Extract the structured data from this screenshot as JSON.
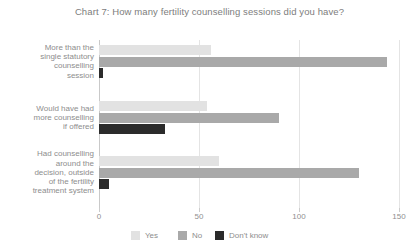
{
  "chart_data": {
    "type": "bar",
    "orientation": "horizontal",
    "title": "Chart 7: How many fertility counselling sessions did you have?",
    "xlabel": "",
    "ylabel": "",
    "xlim": [
      0,
      150
    ],
    "xticks": [
      0,
      50,
      100,
      150
    ],
    "xtick_labels": [
      "0",
      "50",
      "100",
      "150"
    ],
    "grid": "vertical",
    "legend_position": "bottom",
    "categories": [
      "More than the single statutory counselling session",
      "Would have had more counselling if offered",
      "Had counselling around the decision, outside of the fertility treatment system"
    ],
    "category_lines": [
      [
        "More than the",
        "single statutory",
        "counselling",
        "session"
      ],
      [
        "Would have had",
        "more counselling",
        "if offered"
      ],
      [
        "Had counselling",
        "around the",
        "decision, outside",
        "of the fertility",
        "treatment system"
      ]
    ],
    "series": [
      {
        "name": "Yes",
        "color": "#e2e2e2",
        "values": [
          56,
          54,
          60
        ]
      },
      {
        "name": "No",
        "color": "#a9a9a9",
        "values": [
          144,
          90,
          130
        ]
      },
      {
        "name": "Don't know",
        "color": "#2b2b2b",
        "values": [
          2,
          33,
          5
        ]
      }
    ]
  },
  "legend": {
    "items": [
      {
        "label": "Yes",
        "color": "#e2e2e2"
      },
      {
        "label": "No",
        "color": "#a9a9a9"
      },
      {
        "label": "Don't know",
        "color": "#2b2b2b"
      }
    ]
  },
  "colors": {
    "background": "#ffffff",
    "axis": "#c9c9c9",
    "grid": "#e4e4e4",
    "text": "#8a8a8a"
  }
}
